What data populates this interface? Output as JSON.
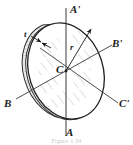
{
  "figure": {
    "caption": "Figure 1.34",
    "colors": {
      "ink": "#1b1b1b",
      "line": "#3a3a3a",
      "hatch": "#9a9a9a",
      "rim": "#bdbdbd",
      "background": "#ffffff",
      "caption": "#c9c9c9"
    },
    "labels": {
      "axis_top": "A'",
      "axis_bottom": "A",
      "axis_right_upper": "B'",
      "axis_left_lower": "B",
      "axis_right_lower": "C'",
      "center": "C",
      "radius": "r",
      "thickness": "t"
    },
    "geometry": {
      "center_x": 66,
      "center_y": 71,
      "ellipse_rx": 37,
      "ellipse_ry": 49,
      "tilt_deg": -18,
      "rim_thickness": 6
    }
  }
}
